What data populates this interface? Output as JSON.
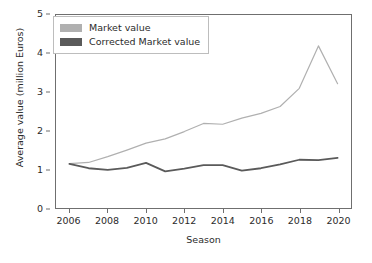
{
  "chart_data": {
    "type": "line",
    "title": "",
    "xlabel": "Season",
    "ylabel": "Average value (million Euros)",
    "xlim": [
      2005.3,
      2020.7
    ],
    "ylim": [
      0,
      5
    ],
    "xticks": [
      2006,
      2008,
      2010,
      2012,
      2014,
      2016,
      2018,
      2020
    ],
    "yticks": [
      0,
      1,
      2,
      3,
      4,
      5
    ],
    "xtick_labels": [
      "2006",
      "2008",
      "2010",
      "2012",
      "2014",
      "2016",
      "2018",
      "2020"
    ],
    "ytick_labels": [
      "0",
      "1",
      "2",
      "3",
      "4",
      "5"
    ],
    "grid": false,
    "legend_position": "upper left",
    "x": [
      2006,
      2007,
      2008,
      2009,
      2010,
      2011,
      2012,
      2013,
      2014,
      2015,
      2016,
      2017,
      2018,
      2019,
      2020
    ],
    "series": [
      {
        "name": "Market value",
        "color": "#b0b0b0",
        "values": [
          1.15,
          1.18,
          1.33,
          1.5,
          1.68,
          1.79,
          1.98,
          2.19,
          2.17,
          2.33,
          2.45,
          2.63,
          3.1,
          4.2,
          3.22
        ]
      },
      {
        "name": "Corrected Market value",
        "color": "#5a5a5a",
        "values": [
          1.14,
          1.03,
          0.99,
          1.04,
          1.17,
          0.95,
          1.02,
          1.11,
          1.11,
          0.97,
          1.03,
          1.13,
          1.25,
          1.24,
          1.3
        ]
      }
    ]
  },
  "legend": {
    "items": [
      {
        "label": "Market value",
        "color": "#b0b0b0"
      },
      {
        "label": "Corrected Market value",
        "color": "#5a5a5a"
      }
    ]
  },
  "axes": {
    "x_title": "Season",
    "y_title": "Average value (million Euros)"
  },
  "colors": {
    "market_value": "#b0b0b0",
    "corrected_market_value": "#5a5a5a",
    "axis": "#6f6f6f",
    "text": "#2b2b2b",
    "background": "#ffffff"
  }
}
